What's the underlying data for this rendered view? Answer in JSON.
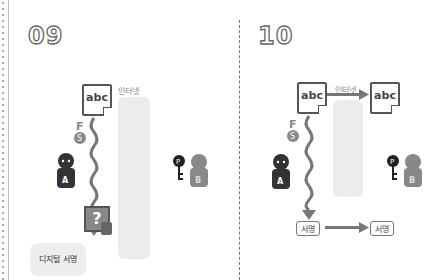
{
  "panels": [
    {
      "number": "09",
      "internet_label": "인터넷",
      "doc_text": "abc",
      "sender": "A",
      "receiver": "B",
      "private_key": "S",
      "public_key": "P",
      "unknown": "?",
      "callout": "디지털 서명"
    },
    {
      "number": "10",
      "internet_label": "인터넷",
      "doc_text": "abc",
      "doc_text_received": "abc",
      "sender": "A",
      "receiver": "B",
      "private_key": "S",
      "public_key": "P",
      "signature": "서명",
      "signature_received": "서명"
    }
  ],
  "colors": {
    "dark": "#333333",
    "gray": "#888888",
    "internet": "#ececec",
    "arrow": "#777777"
  }
}
